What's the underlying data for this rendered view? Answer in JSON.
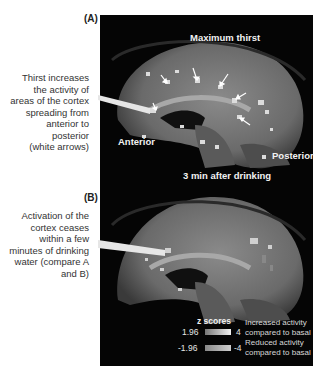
{
  "figure": {
    "panels": [
      {
        "id": "A",
        "label": "(A)",
        "title": "Maximum thirst",
        "orientation_labels": {
          "anterior": "Anterior",
          "posterior": "Posterior"
        },
        "callout_lines": [
          "Thirst  increases",
          "the activity of",
          "areas of the cortex",
          "spreading from",
          "anterior to",
          "posterior",
          "(white arrows)"
        ]
      },
      {
        "id": "B",
        "label": "(B)",
        "title": "3 min after drinking",
        "callout_lines": [
          "Activation of the",
          "cortex ceases",
          "within a few",
          "minutes of drinking",
          "water (compare A",
          "and B)"
        ]
      }
    ],
    "legend": {
      "title": "z scores",
      "increased": {
        "low": "1.96",
        "high": "4",
        "line1": "Increased activity",
        "line2": "compared to basal"
      },
      "reduced": {
        "low": "-1.96",
        "high": "-4",
        "line1": "Reduced activity",
        "line2": "compared to basal"
      }
    },
    "colors": {
      "background": "#050505",
      "brain_tissue": "#6e6e6e",
      "activation": "#dcdcdc",
      "text_on_dark": "#f2f2f2"
    }
  }
}
